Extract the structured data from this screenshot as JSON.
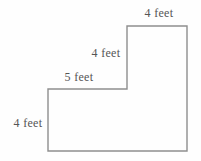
{
  "figure": {
    "labels": {
      "top": "4 feet",
      "upper_left": "4 feet",
      "step": "5 feet",
      "lower_left": "4 feet"
    },
    "colors": {
      "line": "#8e8e8e",
      "text": "#555555",
      "background": "#fefefe"
    }
  }
}
